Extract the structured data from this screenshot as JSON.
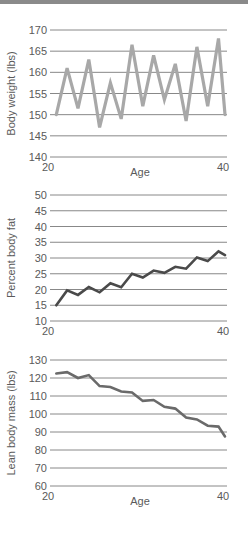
{
  "page": {
    "top_bar_color": "#8a8a8a"
  },
  "chart_data": [
    {
      "type": "line",
      "title": "",
      "xlabel": "Age",
      "ylabel": "Body weight (lbs)",
      "xlim": [
        20,
        40
      ],
      "ylim": [
        140,
        170
      ],
      "x_ticks": [
        "20",
        "40"
      ],
      "y_ticks": [
        "170",
        "165",
        "160",
        "155",
        "150",
        "145",
        "140"
      ],
      "grid": true,
      "line_color": "#a8a8a8",
      "x": [
        20.5,
        21.75,
        23,
        24.25,
        25.5,
        26.75,
        28,
        29.25,
        30.5,
        31.75,
        33,
        34.25,
        35.5,
        36.75,
        38,
        39.25,
        40
      ],
      "values": [
        150,
        161,
        151.5,
        163,
        147,
        157.5,
        149,
        166.5,
        152,
        164,
        153.5,
        162,
        148.5,
        166,
        152,
        168,
        150
      ]
    },
    {
      "type": "line",
      "title": "",
      "xlabel": "",
      "ylabel": "Percent body fat",
      "xlim": [
        20,
        40
      ],
      "ylim": [
        10,
        50
      ],
      "x_ticks": [
        "20",
        "40"
      ],
      "y_ticks": [
        "50",
        "45",
        "40",
        "35",
        "30",
        "25",
        "20",
        "15",
        "10"
      ],
      "grid": true,
      "line_color": "#4a4a4a",
      "x": [
        20.5,
        21.75,
        23,
        24.25,
        25.5,
        26.75,
        28,
        29.25,
        30.5,
        31.75,
        33,
        34.25,
        35.5,
        36.75,
        38,
        39.25,
        40
      ],
      "values": [
        15,
        19.7,
        18.3,
        20.8,
        19.1,
        22,
        20.7,
        25,
        23.8,
        26,
        25.3,
        27.2,
        26.6,
        30.2,
        29,
        32.1,
        30.9
      ]
    },
    {
      "type": "line",
      "title": "",
      "xlabel": "Age",
      "ylabel": "Lean body mass (lbs)",
      "xlim": [
        20,
        40
      ],
      "ylim": [
        60,
        130
      ],
      "x_ticks": [
        "20",
        "40"
      ],
      "y_ticks": [
        "130",
        "120",
        "110",
        "100",
        "90",
        "80",
        "70",
        "60"
      ],
      "grid": true,
      "line_color": "#6a6a6a",
      "x": [
        20.5,
        21.75,
        23,
        24.25,
        25.5,
        26.75,
        28,
        29.25,
        30.5,
        31.75,
        33,
        34.25,
        35.5,
        36.75,
        38,
        39.25,
        40
      ],
      "values": [
        122.5,
        123.3,
        120,
        121.6,
        115.5,
        115,
        112.5,
        112,
        107.3,
        107.8,
        104,
        103,
        98,
        97,
        93.5,
        93,
        87.5
      ]
    }
  ]
}
